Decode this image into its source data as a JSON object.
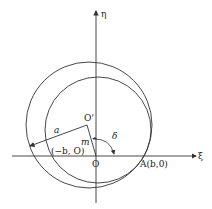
{
  "diagram": {
    "axes": {
      "horizontal_label": "ξ",
      "vertical_label": "η"
    },
    "points": {
      "origin_label": "O",
      "center_label": "O'",
      "point_A_label": "A(b,0)",
      "point_neg_b_label": "(−b, O)"
    },
    "segments": {
      "radius_label": "a",
      "offset_label": "m"
    },
    "angle": {
      "label": "δ"
    },
    "colors": {
      "stroke": "#333333",
      "background": "#ffffff"
    }
  }
}
